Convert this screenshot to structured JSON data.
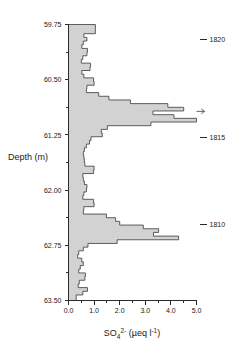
{
  "chart_data": {
    "type": "area",
    "orientation": "horizontal-depth-profile",
    "title": "",
    "xlabel": "SO4 2- (ueq l-1)",
    "xlabel_parts": {
      "species": "SO",
      "subscript": "4",
      "superscript": "2-",
      "units_open": " (",
      "units_mu": "µeq l",
      "units_exp": "-1",
      "units_close": ")"
    },
    "ylabel": "Depth (m)",
    "xlim": [
      0.0,
      5.0
    ],
    "ylim": [
      59.75,
      63.5
    ],
    "y_inverted": true,
    "grid": false,
    "legend": null,
    "xticks": [
      0.0,
      1.0,
      2.0,
      3.0,
      4.0,
      5.0
    ],
    "xticklabels": [
      "0.0",
      "1.0",
      "2.0",
      "3.0",
      "4.0",
      "5.0"
    ],
    "xminorticks": [
      0.5,
      1.5,
      2.5,
      3.5,
      4.5
    ],
    "yticks": [
      59.75,
      60.5,
      61.25,
      62.0,
      62.75,
      63.5
    ],
    "yticklabels": [
      "59.75",
      "60.50",
      "61.25",
      "62.00",
      "62.75",
      "63.50"
    ],
    "yminorticks": [
      60.125,
      60.875,
      61.625,
      62.375,
      63.125
    ],
    "fill_color": "#d2d2d2",
    "line_color": "#3a3a3a",
    "annotations": [
      {
        "label": "1820",
        "depth": 59.95
      },
      {
        "label": "1815",
        "depth": 61.28
      },
      {
        "label": "1810",
        "depth": 62.47
      }
    ],
    "offscale_markers": [
      {
        "depth": 60.93,
        "value": 5.0,
        "note": "value exceeds axis maximum"
      }
    ],
    "series": [
      {
        "name": "SO4 2-",
        "depth": [
          59.8,
          59.85,
          59.9,
          59.95,
          60.0,
          60.05,
          60.1,
          60.15,
          60.2,
          60.25,
          60.3,
          60.35,
          60.4,
          60.45,
          60.5,
          60.55,
          60.6,
          60.65,
          60.7,
          60.75,
          60.8,
          60.85,
          60.9,
          60.95,
          61.0,
          61.05,
          61.1,
          61.15,
          61.2,
          61.25,
          61.3,
          61.35,
          61.4,
          61.45,
          61.5,
          61.55,
          61.6,
          61.65,
          61.7,
          61.75,
          61.8,
          61.85,
          61.9,
          61.95,
          62.0,
          62.05,
          62.1,
          62.15,
          62.2,
          62.25,
          62.3,
          62.35,
          62.4,
          62.45,
          62.5,
          62.55,
          62.6,
          62.65,
          62.7,
          62.75,
          62.8,
          62.85,
          62.9,
          62.95,
          63.0,
          63.05,
          63.1,
          63.15,
          63.2,
          63.25,
          63.3,
          63.35,
          63.4,
          63.45
        ],
        "values": [
          1.05,
          1.05,
          0.6,
          0.72,
          0.58,
          0.52,
          0.74,
          0.72,
          0.56,
          0.5,
          0.86,
          0.84,
          0.52,
          0.6,
          0.98,
          1.0,
          0.72,
          0.7,
          1.18,
          1.58,
          2.42,
          3.88,
          4.5,
          3.3,
          4.12,
          5.0,
          3.22,
          1.52,
          1.28,
          1.32,
          0.88,
          0.82,
          0.7,
          0.62,
          0.58,
          0.6,
          0.62,
          0.64,
          1.0,
          0.98,
          0.56,
          0.58,
          0.62,
          0.72,
          0.7,
          0.6,
          0.56,
          0.98,
          1.0,
          0.6,
          0.58,
          1.48,
          1.84,
          2.0,
          2.92,
          3.52,
          3.32,
          4.3,
          1.9,
          0.76,
          0.58,
          0.4,
          0.36,
          0.52,
          0.58,
          0.46,
          0.4,
          0.66,
          0.64,
          0.42,
          0.38,
          0.74,
          0.56,
          0.3
        ]
      }
    ]
  }
}
